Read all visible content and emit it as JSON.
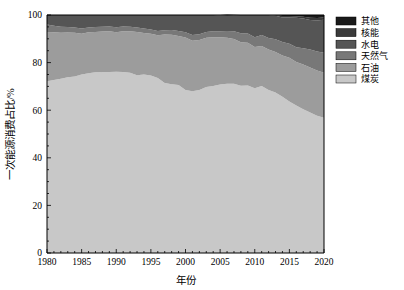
{
  "chart_data": {
    "type": "area",
    "title": "",
    "xlabel": "年份",
    "ylabel": "一次能源消费占比/%",
    "xlim": [
      1980,
      2020
    ],
    "ylim": [
      0,
      100
    ],
    "xticks": [
      1980,
      1985,
      1990,
      1995,
      2000,
      2005,
      2010,
      2015,
      2020
    ],
    "yticks": [
      0,
      20,
      40,
      60,
      80,
      100
    ],
    "xtick_labels": [
      "1980",
      "1985",
      "1990",
      "1995",
      "2000",
      "2005",
      "2010",
      "2015",
      "2020"
    ],
    "ytick_labels": [
      "0",
      "20",
      "40",
      "60",
      "80",
      "100"
    ],
    "grid": false,
    "stacked": true,
    "normalized": true,
    "legend_position": "right-top",
    "x": [
      1980,
      1981,
      1982,
      1983,
      1984,
      1985,
      1986,
      1987,
      1988,
      1989,
      1990,
      1991,
      1992,
      1993,
      1994,
      1995,
      1996,
      1997,
      1998,
      1999,
      2000,
      2001,
      2002,
      2003,
      2004,
      2005,
      2006,
      2007,
      2008,
      2009,
      2010,
      2011,
      2012,
      2013,
      2014,
      2015,
      2016,
      2017,
      2018,
      2019,
      2020
    ],
    "series": [
      {
        "name": "煤炭",
        "color": "#c8c8c8",
        "values": [
          72.2,
          72.7,
          73.2,
          73.8,
          74.2,
          75.0,
          75.5,
          75.9,
          76.0,
          76.1,
          76.2,
          76.1,
          75.7,
          74.7,
          75.0,
          74.6,
          73.5,
          71.4,
          70.9,
          70.6,
          68.5,
          68.0,
          68.5,
          69.8,
          70.2,
          70.8,
          71.1,
          71.1,
          70.3,
          70.4,
          69.2,
          70.2,
          68.5,
          67.4,
          65.6,
          63.7,
          62.0,
          60.4,
          59.0,
          57.7,
          56.8
        ]
      },
      {
        "name": "石油",
        "color": "#9c9c9c",
        "values": [
          20.7,
          20.0,
          19.3,
          18.8,
          18.3,
          17.1,
          17.2,
          17.0,
          17.1,
          17.1,
          16.6,
          17.1,
          17.5,
          18.2,
          17.4,
          17.5,
          18.0,
          20.4,
          20.8,
          20.6,
          22.0,
          21.2,
          21.0,
          20.6,
          20.4,
          19.8,
          19.3,
          18.8,
          18.3,
          17.9,
          17.4,
          16.8,
          17.0,
          17.1,
          17.4,
          18.3,
          18.3,
          18.8,
          18.9,
          19.0,
          18.9
        ]
      },
      {
        "name": "天然气",
        "color": "#787878",
        "values": [
          3.1,
          2.8,
          2.6,
          2.4,
          2.3,
          2.2,
          2.1,
          2.1,
          2.0,
          2.0,
          2.1,
          2.0,
          1.9,
          1.9,
          1.9,
          1.8,
          1.8,
          1.8,
          2.0,
          2.1,
          2.2,
          2.4,
          2.4,
          2.5,
          2.6,
          2.6,
          2.9,
          3.3,
          3.7,
          3.9,
          4.0,
          4.6,
          4.8,
          5.3,
          5.7,
          5.9,
          6.2,
          6.8,
          7.6,
          8.0,
          8.4
        ]
      },
      {
        "name": "水电",
        "color": "#555555",
        "values": [
          4.0,
          4.5,
          4.9,
          5.0,
          5.2,
          5.7,
          5.2,
          5.0,
          4.9,
          4.8,
          5.1,
          4.8,
          4.9,
          5.2,
          5.7,
          6.1,
          6.7,
          6.4,
          6.3,
          6.7,
          7.3,
          8.4,
          8.1,
          7.1,
          6.8,
          6.6,
          6.7,
          6.7,
          7.7,
          7.8,
          9.4,
          8.4,
          9.7,
          9.9,
          10.3,
          11.1,
          12.3,
          12.5,
          12.4,
          13.0,
          13.9
        ]
      },
      {
        "name": "核能",
        "color": "#3a3a3a",
        "values": [
          0.0,
          0.0,
          0.0,
          0.0,
          0.0,
          0.0,
          0.0,
          0.0,
          0.0,
          0.0,
          0.0,
          0.0,
          0.0,
          0.0,
          0.0,
          0.0,
          0.0,
          0.0,
          0.0,
          0.0,
          0.0,
          0.0,
          0.0,
          0.0,
          0.0,
          0.2,
          0.2,
          0.2,
          0.0,
          0.0,
          0.0,
          0.0,
          0.0,
          0.3,
          0.6,
          0.6,
          0.7,
          0.8,
          0.9,
          1.0,
          1.0
        ]
      },
      {
        "name": "其他",
        "color": "#1a1a1a",
        "values": [
          0.0,
          0.0,
          0.0,
          0.0,
          0.0,
          0.0,
          0.0,
          0.0,
          0.0,
          0.0,
          0.0,
          0.0,
          0.0,
          0.0,
          0.0,
          0.0,
          0.0,
          0.0,
          0.0,
          0.0,
          0.0,
          0.0,
          0.0,
          0.0,
          0.0,
          0.0,
          0.0,
          0.0,
          0.0,
          0.0,
          0.0,
          0.0,
          0.0,
          0.0,
          0.4,
          0.4,
          0.5,
          0.7,
          1.2,
          1.3,
          1.0
        ]
      }
    ],
    "legend_entries": [
      {
        "label": "其他",
        "color": "#1a1a1a"
      },
      {
        "label": "核能",
        "color": "#3a3a3a"
      },
      {
        "label": "水电",
        "color": "#555555"
      },
      {
        "label": "天然气",
        "color": "#787878"
      },
      {
        "label": "石油",
        "color": "#9c9c9c"
      },
      {
        "label": "煤炭",
        "color": "#c8c8c8"
      }
    ]
  }
}
